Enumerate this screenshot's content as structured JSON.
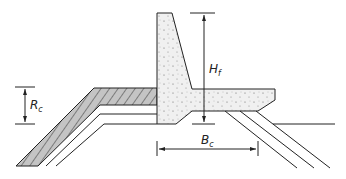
{
  "diagram": {
    "labels": {
      "hf": {
        "main": "H",
        "sub": "f"
      },
      "rc": {
        "main": "R",
        "sub": "c"
      },
      "bc": {
        "main": "B",
        "sub": "c"
      }
    },
    "colors": {
      "line": "#222222",
      "concrete": "#ececec",
      "armour": "#b9b9b9"
    }
  }
}
